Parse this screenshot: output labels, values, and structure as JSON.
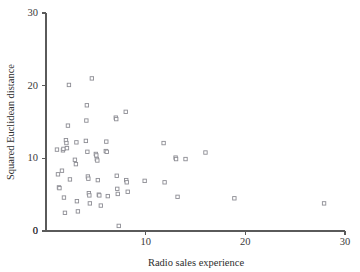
{
  "chart_data": {
    "type": "scatter",
    "title": "",
    "xlabel": "Radio sales experience",
    "ylabel": "Squared Euclidean distance",
    "xlim": [
      0,
      30
    ],
    "ylim": [
      0,
      30
    ],
    "xticks": [
      0,
      10,
      20,
      30
    ],
    "yticks": [
      0,
      10,
      20,
      30
    ],
    "xtick_labels": [
      "0",
      "10",
      "20",
      "30"
    ],
    "ytick_labels": [
      "0",
      "10",
      "20",
      "30"
    ],
    "grid": false,
    "legend": null,
    "marker": "open-square",
    "marker_color": "#8d8d94",
    "marker_fill": "#ffffff",
    "axis_color": "#5a5a5a",
    "points": [
      [
        1.1,
        11.2
      ],
      [
        1.2,
        7.8
      ],
      [
        1.3,
        6.0
      ],
      [
        1.35,
        5.9
      ],
      [
        1.6,
        8.3
      ],
      [
        1.7,
        11.1
      ],
      [
        1.75,
        11.3
      ],
      [
        1.8,
        4.6
      ],
      [
        1.9,
        2.5
      ],
      [
        2.0,
        12.5
      ],
      [
        2.05,
        12.1
      ],
      [
        2.1,
        11.4
      ],
      [
        2.2,
        14.5
      ],
      [
        2.3,
        20.1
      ],
      [
        2.4,
        7.1
      ],
      [
        2.9,
        9.8
      ],
      [
        3.0,
        9.2
      ],
      [
        3.05,
        12.2
      ],
      [
        3.1,
        4.1
      ],
      [
        3.2,
        2.7
      ],
      [
        4.0,
        12.4
      ],
      [
        4.05,
        15.2
      ],
      [
        4.1,
        17.3
      ],
      [
        4.15,
        10.9
      ],
      [
        4.2,
        7.5
      ],
      [
        4.25,
        7.2
      ],
      [
        4.3,
        5.2
      ],
      [
        4.35,
        4.9
      ],
      [
        4.4,
        3.8
      ],
      [
        4.6,
        21.0
      ],
      [
        5.0,
        10.6
      ],
      [
        5.05,
        10.4
      ],
      [
        5.1,
        9.9
      ],
      [
        5.15,
        9.7
      ],
      [
        5.2,
        7.0
      ],
      [
        5.3,
        5.0
      ],
      [
        5.35,
        4.9
      ],
      [
        5.5,
        3.5
      ],
      [
        6.0,
        11.0
      ],
      [
        6.05,
        12.3
      ],
      [
        6.1,
        10.9
      ],
      [
        6.2,
        4.8
      ],
      [
        7.0,
        15.6
      ],
      [
        7.05,
        15.4
      ],
      [
        7.1,
        7.6
      ],
      [
        7.15,
        5.8
      ],
      [
        7.2,
        5.1
      ],
      [
        7.3,
        0.7
      ],
      [
        8.0,
        16.4
      ],
      [
        8.05,
        7.0
      ],
      [
        8.1,
        6.7
      ],
      [
        8.2,
        5.4
      ],
      [
        9.9,
        6.9
      ],
      [
        11.8,
        12.1
      ],
      [
        11.9,
        6.7
      ],
      [
        13.0,
        10.1
      ],
      [
        13.05,
        9.9
      ],
      [
        13.2,
        4.7
      ],
      [
        14.0,
        9.9
      ],
      [
        16.0,
        10.8
      ],
      [
        18.9,
        4.5
      ],
      [
        27.9,
        3.8
      ]
    ]
  }
}
